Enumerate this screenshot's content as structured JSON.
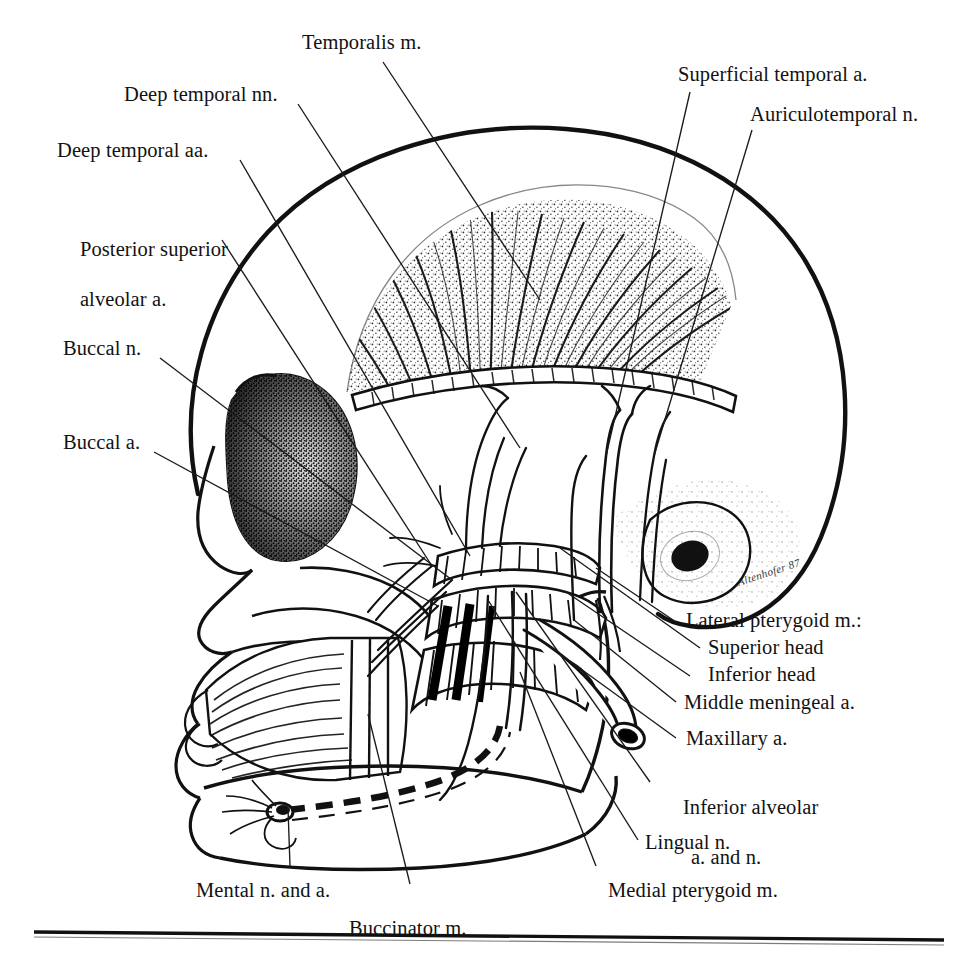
{
  "plate": {
    "title": "Infratemporal fossa, lateral view",
    "artist_signature": "Altenhofer 87",
    "background_color": "#ffffff",
    "ink_color": "#121212",
    "leader_line_color": "#1a1a1a"
  },
  "labels": {
    "temporalis": "Temporalis m.",
    "deep_temporal_nn": "Deep temporal nn.",
    "deep_temporal_aa": "Deep temporal aa.",
    "posterior_superior_alveolar_line1": "Posterior superior",
    "posterior_superior_alveolar_line2": "alveolar a.",
    "buccal_n": "Buccal n.",
    "buccal_a": "Buccal a.",
    "superficial_temporal_a": "Superficial temporal a.",
    "auriculotemporal_n": "Auriculotemporal n.",
    "lateral_pterygoid": "Lateral pterygoid m.:",
    "superior_head": "Superior head",
    "inferior_head": "Inferior head",
    "middle_meningeal_a": "Middle meningeal a.",
    "maxillary_a": "Maxillary a.",
    "inferior_alveolar_line1": "Inferior alveolar",
    "inferior_alveolar_line2": "a. and n.",
    "lingual_n": "Lingual n.",
    "mental_n_and_a": "Mental n. and a.",
    "buccinator": "Buccinator m.",
    "medial_pterygoid": "Medial pterygoid m."
  },
  "structures": {
    "cranial_vault": "cranial-vault-outline",
    "temporalis_muscle": "temporalis-muscle-fan",
    "zygomatic_arch": "zygomatic-arch-cut",
    "orbit": "orbital-rim",
    "maxilla": "maxilla",
    "mandible": "mandible-body",
    "mandibular_canal": "mandibular-canal-dashed",
    "mental_foramen": "mental-foramen",
    "buccinator_muscle": "buccinator-muscle",
    "lateral_pterygoid_superior": "lateral-pterygoid-superior-head",
    "lateral_pterygoid_inferior": "lateral-pterygoid-inferior-head",
    "medial_pterygoid_muscle": "medial-pterygoid-muscle",
    "maxillary_artery": "maxillary-artery-stump",
    "external_acoustic_meatus": "external-acoustic-meatus"
  },
  "footer": {
    "rule": "bottom-horizontal-rule"
  }
}
